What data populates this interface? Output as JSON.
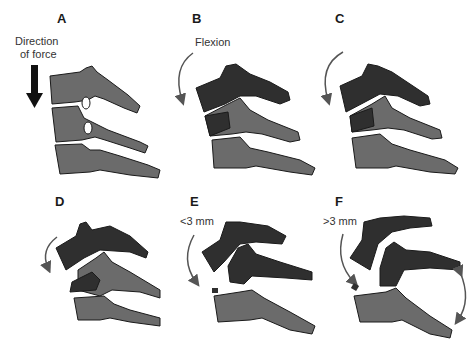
{
  "figure": {
    "colors": {
      "light_bone": "#6b6b6b",
      "dark_bone": "#2f2f2f",
      "cartilage": "#a8a8a8",
      "arrow": "#555555",
      "text": "#1a1a1a"
    },
    "panels": [
      {
        "label": "A",
        "annotation_lines": [
          "Direction",
          "of force"
        ]
      },
      {
        "label": "B",
        "annotation_lines": [
          "Flexion"
        ]
      },
      {
        "label": "C",
        "annotation_lines": []
      },
      {
        "label": "D",
        "annotation_lines": []
      },
      {
        "label": "E",
        "annotation_lines": [
          "<3 mm"
        ]
      },
      {
        "label": "F",
        "annotation_lines": [
          ">3 mm"
        ]
      }
    ]
  }
}
